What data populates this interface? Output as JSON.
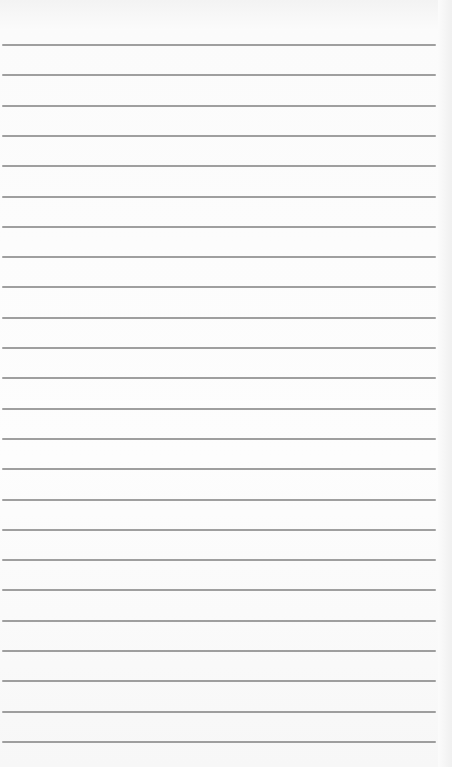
{
  "paper": {
    "type": "lined-paper",
    "background_color": "#fbfbfb",
    "line_color": "#8e8e8e",
    "line_count": 24,
    "first_line_y": 44,
    "line_spacing": 30.3,
    "line_left": 2,
    "line_width": 434
  }
}
